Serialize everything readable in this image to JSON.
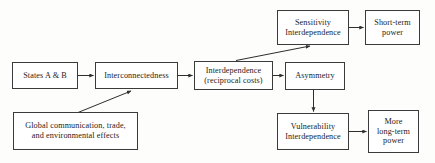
{
  "diagram": {
    "style": {
      "background": "#fdfdfc",
      "box_border": "#3b3b3b",
      "box_fill": "#ffffff",
      "text_color": "#1c1c1c",
      "edge_color": "#3b3b3b"
    },
    "nodes": [
      {
        "id": "states",
        "label": "States A & B"
      },
      {
        "id": "intercon",
        "label": "Interconnectedness"
      },
      {
        "id": "interdep",
        "label": "Interdependence\n(reciprocal costs)"
      },
      {
        "id": "asym",
        "label": "Asymmetry"
      },
      {
        "id": "sens",
        "label": "Sensitivity\nInterdependence"
      },
      {
        "id": "short",
        "label": "Short-term\npower"
      },
      {
        "id": "vuln",
        "label": "Vulnerability\nInterdependence"
      },
      {
        "id": "more",
        "label": "More\nlong-term\npower"
      },
      {
        "id": "global",
        "label": "Global communication, trade,\nand environmental effects"
      }
    ],
    "edges": [
      {
        "from": "states",
        "to": "intercon",
        "kind": "horizontal-arrow"
      },
      {
        "from": "intercon",
        "to": "interdep",
        "kind": "horizontal-arrow"
      },
      {
        "from": "interdep",
        "to": "asym",
        "kind": "horizontal-arrow"
      },
      {
        "from": "global",
        "to": "intercon",
        "kind": "diagonal-arrow-up-right"
      },
      {
        "from": "interdep",
        "to": "sens",
        "kind": "diagonal-arrow-up-right"
      },
      {
        "from": "sens",
        "to": "short",
        "kind": "horizontal-arrow"
      },
      {
        "from": "asym",
        "to": "vuln",
        "kind": "vertical-arrow-down"
      },
      {
        "from": "vuln",
        "to": "more",
        "kind": "horizontal-arrow"
      }
    ]
  }
}
